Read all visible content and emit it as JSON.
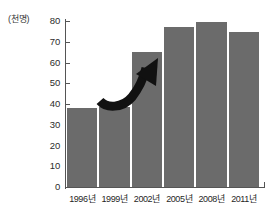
{
  "chart_data": {
    "type": "bar",
    "title": "",
    "subtitle": "",
    "xlabel": "",
    "ylabel": "(천명)",
    "unit_label": "(천명)",
    "categories": [
      "1996년",
      "1999년",
      "2002년",
      "2005년",
      "2008년",
      "2011년"
    ],
    "values": [
      38,
      38.5,
      65,
      77,
      79.5,
      74.5
    ],
    "series": [
      {
        "name": "",
        "values": [
          38,
          38.5,
          65,
          77,
          79.5,
          74.5
        ]
      }
    ],
    "ylim": [
      0,
      80
    ],
    "ytick_values": [
      80,
      70,
      60,
      50,
      40,
      30,
      20,
      10,
      0
    ],
    "ytick_labels": [
      "80",
      "70",
      "60",
      "50",
      "40",
      "30",
      "20",
      "10",
      "0"
    ],
    "ytick_step": 10,
    "grid": false,
    "legend": null,
    "legend_position": "none",
    "annotations": [
      {
        "name": "rising-trend-arrow",
        "type": "curved-arrow",
        "direction": "up-right",
        "from_category": "1999년",
        "to_category": "2002년",
        "label": ""
      }
    ],
    "colors": {
      "bar_fill": "#6b6b6b",
      "bar_gap": "#ffffff",
      "axis": "#555555",
      "text": "#1f1f1f",
      "background": "#ffffff",
      "annotation": "#111111"
    }
  }
}
